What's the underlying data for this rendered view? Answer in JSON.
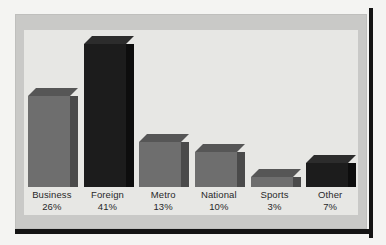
{
  "chart_data": {
    "type": "bar",
    "title": "",
    "subtitle": "",
    "xlabel": "",
    "ylabel": "",
    "grid": false,
    "legend": "none",
    "ylim": [
      0,
      45
    ],
    "categories": [
      "Business",
      "Foreign",
      "Metro",
      "National",
      "Sports",
      "Other"
    ],
    "values": [
      26,
      41,
      13,
      10,
      3,
      7
    ],
    "value_suffix": "%",
    "tick_labels": [
      "26%",
      "41%",
      "13%",
      "10%",
      "3%",
      "7%"
    ],
    "bars": [
      {
        "label": "Business",
        "value": 26,
        "value_text": "26%",
        "tone": "gray"
      },
      {
        "label": "Foreign",
        "value": 41,
        "value_text": "41%",
        "tone": "black"
      },
      {
        "label": "Metro",
        "value": 13,
        "value_text": "13%",
        "tone": "gray"
      },
      {
        "label": "National",
        "value": 10,
        "value_text": "10%",
        "tone": "gray"
      },
      {
        "label": "Sports",
        "value": 3,
        "value_text": "3%",
        "tone": "gray"
      },
      {
        "label": "Other",
        "value": 7,
        "value_text": "7%",
        "tone": "black"
      }
    ]
  },
  "colors": {
    "page_background": "#f4f4f2",
    "frame_band": "#c9c9c7",
    "plot_panel": "#e7e7e4",
    "rail": "#141414",
    "bar_gray_front": "#6e6e6e",
    "bar_gray_top": "#565656",
    "bar_gray_side": "#4a4a4a",
    "bar_black_front": "#1c1c1c",
    "bar_black_top": "#2c2c2c",
    "bar_black_side": "#0d0d0d",
    "label_text": "#27272a"
  }
}
